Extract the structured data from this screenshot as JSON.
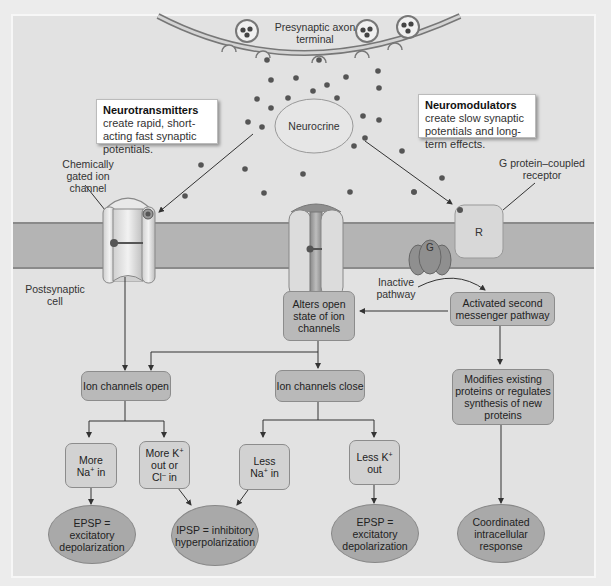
{
  "diagram": {
    "presynaptic_label": "Presynaptic axon terminal",
    "neurocrine_label": "Neurocrine",
    "postsynaptic_label": "Postsynaptic cell",
    "chem_channel_label": "Chemically gated ion channel",
    "gpcr_label": "G protein–coupled receptor",
    "receptor_letter": "R",
    "gprotein_letter": "G",
    "inactive_pathway_label": "Inactive pathway",
    "callouts": {
      "neurotransmitters": {
        "bold": "Neurotransmitters",
        "text": " create rapid, short-acting fast synaptic potentials."
      },
      "neuromodulators": {
        "bold": "Neuromodulators",
        "text": " create slow synaptic potentials and long-term effects."
      }
    },
    "boxes": {
      "alters_open_state": "Alters open state of ion channels",
      "activated_second_messenger": "Activated second messenger pathway",
      "ion_channels_open": "Ion channels open",
      "ion_channels_close": "Ion channels close",
      "modifies_proteins": "Modifies existing proteins or regulates synthesis of new proteins",
      "more_na_in": {
        "l1": "More",
        "l2a": "Na",
        "sup": "+",
        "l2b": " in"
      },
      "more_k_out_cl_in": {
        "l1a": "More K",
        "sup1": "+",
        "l2": "out or",
        "l3a": "Cl",
        "sup2": "–",
        "l3b": " in"
      },
      "less_na_in": {
        "l1": "Less",
        "l2a": "Na",
        "sup": "+",
        "l2b": " in"
      },
      "less_k_out": {
        "l1a": "Less K",
        "sup": "+",
        "l2": "out"
      }
    },
    "outcomes": {
      "epsp_left": "EPSP = excitatory depolarization",
      "ipsp": "IPSP = inhibitory hyperpolarization",
      "epsp_right": "EPSP = excitatory depolarization",
      "coordinated": "Coordinated intracellular response"
    },
    "colors": {
      "background": "#e2e2e2",
      "membrane": "#b4b4b4",
      "box": "#b9b9b9",
      "dot": "#555555"
    }
  }
}
